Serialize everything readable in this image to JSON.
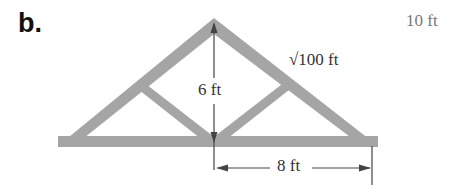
{
  "part_label": "b.",
  "labels": {
    "height": "6 ft",
    "rafter": "√100 ft",
    "half_span": "8 ft",
    "answer": "10 ft"
  },
  "colors": {
    "truss": "#a5a5a5",
    "lines": "#444444",
    "text": "#333333",
    "answer_text": "#777777"
  }
}
